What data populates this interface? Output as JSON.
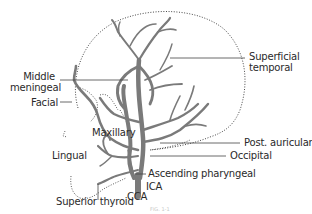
{
  "figure": {
    "type": "anatomical-diagram",
    "vessel_color": "#7a7a7a",
    "outline_color": "#333333",
    "leader_color": "#444444",
    "caption": "FIG. 1-1"
  },
  "labels": {
    "superficial_temporal": [
      "Superficial",
      "temporal"
    ],
    "middle_meningeal": [
      "Middle",
      "meningeal"
    ],
    "facial": "Facial",
    "post_auricular": "Post. auricular",
    "occipital": "Occipital",
    "maxillary": "Maxillary",
    "lingual": "Lingual",
    "ascending_pharyngeal": "Ascending pharyngeal",
    "ica": "ICA",
    "superior_thyroid": "Superior thyroid",
    "cca": "CCA"
  }
}
